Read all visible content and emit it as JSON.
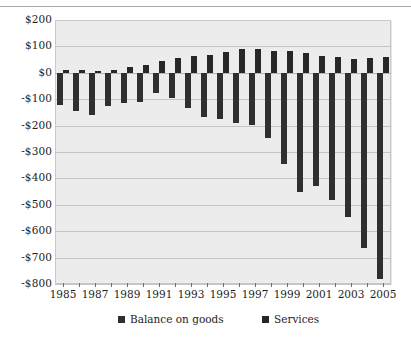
{
  "chart_data": {
    "type": "bar",
    "title": "",
    "subtitle": "",
    "xlabel": "",
    "ylabel": "",
    "grid": true,
    "legend_position": "bottom",
    "ylim": [
      -800,
      200
    ],
    "ytick_step": 100,
    "ytick_labels": [
      "$200",
      "$100",
      "$0",
      "-$100",
      "-$200",
      "-$300",
      "-$400",
      "-$500",
      "-$600",
      "-$700",
      "-$800"
    ],
    "ytick_values": [
      200,
      100,
      0,
      -100,
      -200,
      -300,
      -400,
      -500,
      -600,
      -700,
      -800
    ],
    "categories": [
      1985,
      1986,
      1987,
      1988,
      1989,
      1990,
      1991,
      1992,
      1993,
      1994,
      1995,
      1996,
      1997,
      1998,
      1999,
      2000,
      2001,
      2002,
      2003,
      2004,
      2005
    ],
    "xtick_labels": [
      "1985",
      "1987",
      "1989",
      "1991",
      "1993",
      "1995",
      "1997",
      "1999",
      "2001",
      "2003",
      "2005"
    ],
    "xtick_values": [
      1985,
      1987,
      1989,
      1991,
      1993,
      1995,
      1997,
      1999,
      2001,
      2003,
      2005
    ],
    "series": [
      {
        "name": "Balance on goods",
        "color": "#2f2f2f",
        "values": [
          -122,
          -145,
          -160,
          -127,
          -116,
          -111,
          -77,
          -97,
          -133,
          -166,
          -174,
          -191,
          -198,
          -248,
          -346,
          -452,
          -427,
          -483,
          -547,
          -665,
          -782
        ]
      },
      {
        "name": "Services",
        "color": "#272727",
        "values": [
          10,
          12,
          7,
          12,
          23,
          30,
          45,
          56,
          62,
          67,
          78,
          89,
          90,
          82,
          84,
          75,
          65,
          61,
          54,
          55,
          58
        ]
      }
    ]
  },
  "legend": {
    "items": [
      {
        "label": "Balance on goods",
        "swatch_name": "legend-swatch-goods"
      },
      {
        "label": "Services",
        "swatch_name": "legend-swatch-services"
      }
    ]
  }
}
